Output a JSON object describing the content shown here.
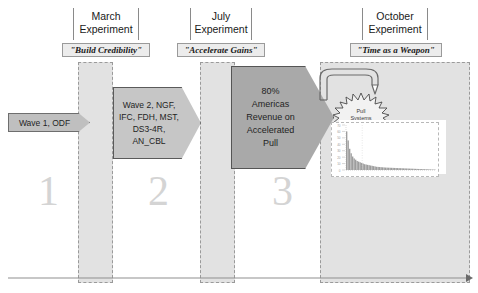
{
  "diagram": {
    "phases": [
      {
        "number": "1",
        "header_line1": "March",
        "header_line2": "Experiment",
        "theme": "\"Build Credibility\""
      },
      {
        "number": "2",
        "header_line1": "July",
        "header_line2": "Experiment",
        "theme": "\"Accelerate Gains\""
      },
      {
        "number": "3",
        "header_line1": "October",
        "header_line2": "Experiment",
        "theme": "\"Time as a Weapon\""
      }
    ],
    "arrows": [
      {
        "name": "wave-1",
        "lines": [
          "Wave 1, ODF"
        ]
      },
      {
        "name": "wave-2",
        "lines": [
          "Wave 2, NGF,",
          "IFC, FDH, MST,",
          "DS3-4R,",
          "AN_CBL"
        ]
      },
      {
        "name": "americas-revenue",
        "lines": [
          "80%",
          "Americas",
          "Revenue on",
          "Accelerated",
          "Pull"
        ]
      }
    ],
    "burst": {
      "line1": "Pull",
      "line2": "Systems"
    },
    "colors": {
      "band_fill": "#e2e2e2",
      "band_border": "#9a9a9a",
      "chevron_light": "#bfbfbf",
      "chevron_mid": "#c6c6c6",
      "chevron_dark": "#a9a9a9",
      "stage_number": "#d4d4d4",
      "baseline": "#8f8f8f"
    }
  },
  "chart_data": {
    "type": "bar",
    "title": "",
    "subtitle": "",
    "xlabel": "",
    "ylabel": "",
    "categories": [
      "1",
      "2",
      "3",
      "4",
      "5",
      "6",
      "7",
      "8",
      "9",
      "10",
      "11",
      "12",
      "13",
      "14",
      "15",
      "16",
      "17",
      "18",
      "19",
      "20",
      "21",
      "22",
      "23",
      "24",
      "25",
      "26",
      "27",
      "28",
      "29",
      "30",
      "31",
      "32",
      "33",
      "34",
      "35",
      "36",
      "37",
      "38",
      "39",
      "40",
      "41",
      "42",
      "43",
      "44",
      "45",
      "46",
      "47",
      "48",
      "49",
      "50",
      "51",
      "52",
      "53",
      "54",
      "55",
      "56",
      "57",
      "58",
      "59",
      "60"
    ],
    "values": [
      60,
      46,
      33,
      26,
      21,
      18,
      16,
      14,
      13,
      12,
      11,
      10,
      9,
      8.5,
      8,
      7.5,
      7,
      6.5,
      6,
      5.5,
      5,
      4.8,
      4.6,
      4.4,
      4.2,
      4,
      3.8,
      3.7,
      3.6,
      3.5,
      3.4,
      3.3,
      3.2,
      3.1,
      3,
      2.9,
      2.8,
      2.7,
      2.6,
      2.5,
      2.4,
      2.3,
      2.2,
      2.1,
      2,
      1.9,
      1.8,
      1.7,
      1.6,
      1.5,
      1.4,
      1.3,
      1.2,
      1.1,
      1.0,
      0.9,
      0.8,
      0.7,
      0.6,
      0.5
    ],
    "ytick_labels": [
      "70",
      "60",
      "50",
      "40",
      "30",
      "20",
      "10",
      "0"
    ],
    "ylim": [
      0,
      70
    ],
    "grid": false,
    "legend": "none",
    "series": [
      {
        "name": "Cycle time distribution",
        "values": [
          60,
          46,
          33,
          26,
          21,
          18,
          16,
          14,
          13,
          12,
          11,
          10,
          9,
          8.5,
          8,
          7.5,
          7,
          6.5,
          6,
          5.5,
          5,
          4.8,
          4.6,
          4.4,
          4.2,
          4,
          3.8,
          3.7,
          3.6,
          3.5,
          3.4,
          3.3,
          3.2,
          3.1,
          3,
          2.9,
          2.8,
          2.7,
          2.6,
          2.5,
          2.4,
          2.3,
          2.2,
          2.1,
          2,
          1.9,
          1.8,
          1.7,
          1.6,
          1.5,
          1.4,
          1.3,
          1.2,
          1.1,
          1.0,
          0.9,
          0.8,
          0.7,
          0.6,
          0.5
        ]
      }
    ]
  }
}
